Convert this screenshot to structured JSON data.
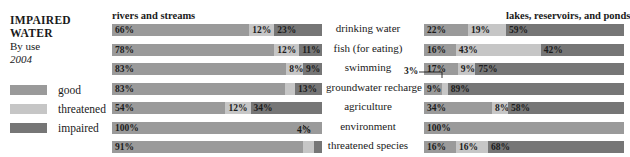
{
  "title": {
    "line1": "IMPAIRED",
    "line2": "WATER",
    "subtitle": "By use",
    "year": "2004"
  },
  "legend": {
    "items": [
      {
        "label": "good",
        "color": "#9a9a9a"
      },
      {
        "label": "threatened",
        "color": "#c6c6c6"
      },
      {
        "label": "impaired",
        "color": "#767676"
      }
    ]
  },
  "groups": {
    "left": "rivers and streams",
    "right": "lakes, reservoirs, and ponds"
  },
  "categories": [
    "drinking water",
    "fish (for eating)",
    "swimming",
    "groundwater recharge",
    "agriculture",
    "environment",
    "threatened species"
  ],
  "callouts": {
    "left_4": "4%",
    "right_3": "3%"
  },
  "chart_data": {
    "type": "bar",
    "subtype": "stacked-horizontal-100%",
    "xlabel": "",
    "ylabel": "",
    "xlim": [
      0,
      100
    ],
    "grid": false,
    "legend_position": "left",
    "series": [
      {
        "name": "good",
        "color": "#9a9a9a"
      },
      {
        "name": "threatened",
        "color": "#c6c6c6"
      },
      {
        "name": "impaired",
        "color": "#767676"
      }
    ],
    "panels": [
      {
        "name": "rivers and streams",
        "categories": [
          "drinking water",
          "fish (for eating)",
          "swimming",
          "groundwater recharge",
          "agriculture",
          "environment",
          "threatened species"
        ],
        "rows": [
          {
            "category": "drinking water",
            "segments": [
              {
                "series": "good",
                "value": 66,
                "label": "66%"
              },
              {
                "series": "threatened",
                "value": 12,
                "label": "12%"
              },
              {
                "series": "impaired",
                "value": 23,
                "label": "23%"
              }
            ]
          },
          {
            "category": "fish (for eating)",
            "segments": [
              {
                "series": "good",
                "value": 78,
                "label": "78%"
              },
              {
                "series": "threatened",
                "value": 12,
                "label": "12%"
              },
              {
                "series": "impaired",
                "value": 11,
                "label": "11%"
              }
            ]
          },
          {
            "category": "swimming",
            "segments": [
              {
                "series": "good",
                "value": 83,
                "label": "83%"
              },
              {
                "series": "threatened",
                "value": 8,
                "label": "8%"
              },
              {
                "series": "impaired",
                "value": 9,
                "label": "9%"
              }
            ]
          },
          {
            "category": "groundwater recharge",
            "segments": [
              {
                "series": "good",
                "value": 83,
                "label": "83%"
              },
              {
                "series": "threatened",
                "value": 5,
                "label": "5%"
              },
              {
                "series": "impaired",
                "value": 13,
                "label": "13%"
              }
            ]
          },
          {
            "category": "agriculture",
            "segments": [
              {
                "series": "good",
                "value": 54,
                "label": "54%"
              },
              {
                "series": "threatened",
                "value": 12,
                "label": "12%"
              },
              {
                "series": "impaired",
                "value": 34,
                "label": "34%"
              }
            ]
          },
          {
            "category": "environment",
            "segments": [
              {
                "series": "good",
                "value": 100,
                "label": "100%"
              }
            ]
          },
          {
            "category": "threatened species",
            "segments": [
              {
                "series": "good",
                "value": 91,
                "label": "91%"
              },
              {
                "series": "threatened",
                "value": 5,
                "label": "5%"
              },
              {
                "series": "impaired",
                "value": 4,
                "label": "4%",
                "callout": true
              }
            ]
          }
        ]
      },
      {
        "name": "lakes, reservoirs, and ponds",
        "categories": [
          "drinking water",
          "fish (for eating)",
          "swimming",
          "groundwater recharge",
          "agriculture",
          "environment",
          "threatened species"
        ],
        "rows": [
          {
            "category": "drinking water",
            "segments": [
              {
                "series": "good",
                "value": 22,
                "label": "22%"
              },
              {
                "series": "threatened",
                "value": 19,
                "label": "19%"
              },
              {
                "series": "impaired",
                "value": 59,
                "label": "59%"
              }
            ]
          },
          {
            "category": "fish (for eating)",
            "segments": [
              {
                "series": "good",
                "value": 16,
                "label": "16%"
              },
              {
                "series": "threatened",
                "value": 43,
                "label": "43%"
              },
              {
                "series": "impaired",
                "value": 42,
                "label": "42%"
              }
            ]
          },
          {
            "category": "swimming",
            "segments": [
              {
                "series": "good",
                "value": 17,
                "label": "17%"
              },
              {
                "series": "threatened",
                "value": 9,
                "label": "9%"
              },
              {
                "series": "impaired",
                "value": 75,
                "label": "75%"
              }
            ]
          },
          {
            "category": "groundwater recharge",
            "segments": [
              {
                "series": "good",
                "value": 9,
                "label": "9%"
              },
              {
                "series": "threatened",
                "value": 3,
                "label": "3%",
                "callout": true
              },
              {
                "series": "impaired",
                "value": 89,
                "label": "89%"
              }
            ]
          },
          {
            "category": "agriculture",
            "segments": [
              {
                "series": "good",
                "value": 34,
                "label": "34%"
              },
              {
                "series": "threatened",
                "value": 8,
                "label": "8%"
              },
              {
                "series": "impaired",
                "value": 58,
                "label": "58%"
              }
            ]
          },
          {
            "category": "environment",
            "segments": [
              {
                "series": "good",
                "value": 100,
                "label": "100%"
              }
            ]
          },
          {
            "category": "threatened species",
            "segments": [
              {
                "series": "good",
                "value": 16,
                "label": "16%"
              },
              {
                "series": "threatened",
                "value": 16,
                "label": "16%"
              },
              {
                "series": "impaired",
                "value": 68,
                "label": "68%"
              }
            ]
          }
        ]
      }
    ]
  }
}
